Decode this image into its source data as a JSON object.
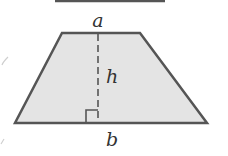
{
  "diagram": {
    "type": "trapezoid",
    "labels": {
      "top_base": "a",
      "height": "h",
      "bottom_base": "b"
    },
    "colors": {
      "fill": "#e4e4e4",
      "stroke": "#555555",
      "text": "#333333"
    },
    "right_angle_marker": true,
    "height_line_style": "dashed"
  }
}
